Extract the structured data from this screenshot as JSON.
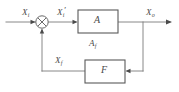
{
  "diagram": {
    "type": "block-diagram",
    "background_color": "#ffffff",
    "line_color": "#7a7a7a",
    "box_stroke_color": "#5a5a5a",
    "text_color": "#4a4a4a",
    "signals": {
      "input": {
        "base": "X",
        "sub": "i",
        "prime": "",
        "text": "Xi"
      },
      "error": {
        "base": "X",
        "sub": "i",
        "prime": "′",
        "text": "Xi′"
      },
      "output": {
        "base": "X",
        "sub": "o",
        "prime": "",
        "text": "Xo"
      },
      "feedback": {
        "base": "X",
        "sub": "f",
        "prime": "",
        "text": "Xf"
      }
    },
    "blocks": [
      {
        "name": "forward-amplifier",
        "label": "A"
      },
      {
        "name": "feedback-network",
        "label": "F"
      }
    ],
    "annotations": [
      {
        "name": "closed-loop-gain",
        "base": "A",
        "sub": "f",
        "text": "Af"
      }
    ],
    "summing_junction": {
      "name": "summing-junction",
      "glyph": "⊗",
      "inputs": 2,
      "outputs": 1
    }
  }
}
